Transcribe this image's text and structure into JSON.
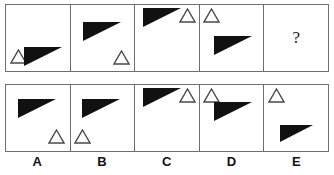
{
  "puzzle": {
    "type": "visual-analogy-matrix",
    "question_row": {
      "cells": [
        {
          "id": "q1",
          "shapes": [
            {
              "kind": "hollow-triangle",
              "size": 17,
              "x": 4,
              "y": 44
            },
            {
              "kind": "solid-triangle",
              "w": 38,
              "h": 19,
              "x": 18,
              "y": 42
            }
          ]
        },
        {
          "id": "q2",
          "shapes": [
            {
              "kind": "solid-triangle",
              "w": 38,
              "h": 19,
              "x": 12,
              "y": 17
            },
            {
              "kind": "hollow-triangle",
              "size": 17,
              "x": 42,
              "y": 45
            }
          ]
        },
        {
          "id": "q3",
          "shapes": [
            {
              "kind": "solid-triangle",
              "w": 38,
              "h": 19,
              "x": 8,
              "y": 3
            },
            {
              "kind": "hollow-triangle",
              "size": 17,
              "x": 44,
              "y": 3
            }
          ]
        },
        {
          "id": "q4",
          "shapes": [
            {
              "kind": "hollow-triangle",
              "size": 17,
              "x": 3,
              "y": 3
            },
            {
              "kind": "solid-triangle",
              "w": 38,
              "h": 19,
              "x": 14,
              "y": 31
            }
          ]
        },
        {
          "id": "q5",
          "question_mark": "?",
          "shapes": []
        }
      ]
    },
    "options_row": {
      "cells": [
        {
          "id": "A",
          "label": "A",
          "shapes": [
            {
              "kind": "solid-triangle",
              "w": 38,
              "h": 19,
              "x": 12,
              "y": 14
            },
            {
              "kind": "hollow-triangle",
              "size": 17,
              "x": 42,
              "y": 44
            }
          ]
        },
        {
          "id": "B",
          "label": "B",
          "shapes": [
            {
              "kind": "solid-triangle",
              "w": 38,
              "h": 19,
              "x": 11,
              "y": 14
            },
            {
              "kind": "hollow-triangle",
              "size": 17,
              "x": 3,
              "y": 44
            }
          ]
        },
        {
          "id": "C",
          "label": "C",
          "shapes": [
            {
              "kind": "solid-triangle",
              "w": 38,
              "h": 19,
              "x": 8,
              "y": 3
            },
            {
              "kind": "hollow-triangle",
              "size": 17,
              "x": 44,
              "y": 3
            }
          ]
        },
        {
          "id": "D",
          "label": "D",
          "shapes": [
            {
              "kind": "hollow-triangle",
              "size": 17,
              "x": 3,
              "y": 3
            },
            {
              "kind": "solid-triangle",
              "w": 38,
              "h": 19,
              "x": 14,
              "y": 17
            }
          ]
        },
        {
          "id": "E",
          "label": "E",
          "shapes": [
            {
              "kind": "hollow-triangle",
              "size": 17,
              "x": 4,
              "y": 3
            },
            {
              "kind": "solid-triangle",
              "w": 33,
              "h": 17,
              "x": 16,
              "y": 40
            }
          ]
        }
      ]
    },
    "labels": [
      "A",
      "B",
      "C",
      "D",
      "E"
    ],
    "colors": {
      "solid_fill": "#111111",
      "outline_stroke": "#4a4a4a",
      "border": "#6e6e6e",
      "background": "#ffffff"
    }
  }
}
